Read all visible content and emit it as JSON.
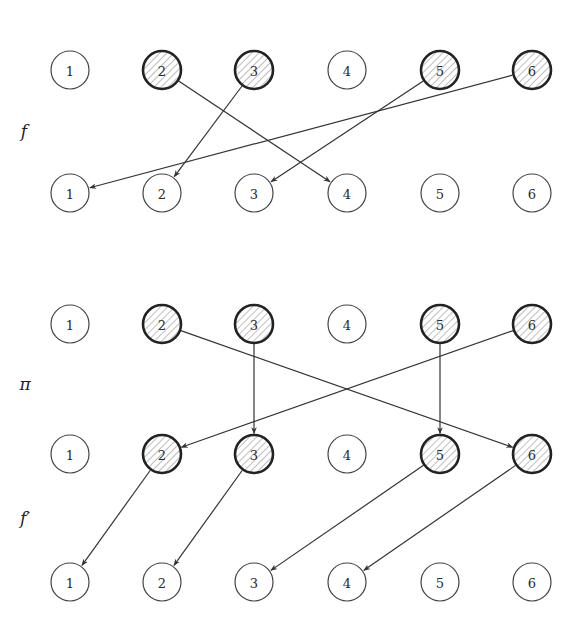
{
  "figure": {
    "width": 582,
    "height": 631,
    "node_radius": 19,
    "column_x": [
      70,
      162,
      254,
      347,
      440,
      532
    ],
    "colors": {
      "ink": "#333333",
      "plain_stroke": "#444444",
      "hatched_stroke": "#222222",
      "hatch_line": "#888888",
      "background": "#ffffff"
    },
    "rows": [
      {
        "id": "f-source",
        "y": 70,
        "labels": [
          "1",
          "2",
          "3",
          "4",
          "5",
          "6"
        ],
        "hatched": [
          "2",
          "3",
          "5",
          "6"
        ]
      },
      {
        "id": "f-target",
        "y": 193,
        "labels": [
          "1",
          "2",
          "3",
          "4",
          "5",
          "6"
        ],
        "hatched": []
      },
      {
        "id": "pi-source",
        "y": 324,
        "labels": [
          "1",
          "2",
          "3",
          "4",
          "5",
          "6"
        ],
        "hatched": [
          "2",
          "3",
          "5",
          "6"
        ]
      },
      {
        "id": "pi-target",
        "y": 454,
        "labels": [
          "1",
          "2",
          "3",
          "4",
          "5",
          "6"
        ],
        "hatched": [
          "2",
          "3",
          "5",
          "6"
        ]
      },
      {
        "id": "fprime-target",
        "y": 582,
        "labels": [
          "1",
          "2",
          "3",
          "4",
          "5",
          "6"
        ],
        "hatched": []
      }
    ],
    "mappings": [
      {
        "name": "f",
        "label": "f",
        "label_pos": [
          24,
          131
        ],
        "from_row": 0,
        "to_row": 1,
        "edges": [
          {
            "from": "2",
            "to": "4"
          },
          {
            "from": "3",
            "to": "2"
          },
          {
            "from": "5",
            "to": "3"
          },
          {
            "from": "6",
            "to": "1"
          }
        ]
      },
      {
        "name": "pi",
        "label": "π",
        "label_pos": [
          25,
          384
        ],
        "from_row": 2,
        "to_row": 3,
        "edges": [
          {
            "from": "2",
            "to": "6"
          },
          {
            "from": "3",
            "to": "3"
          },
          {
            "from": "5",
            "to": "5"
          },
          {
            "from": "6",
            "to": "2"
          }
        ]
      },
      {
        "name": "f-prime",
        "label": "f′",
        "label_pos": [
          25,
          518
        ],
        "from_row": 3,
        "to_row": 4,
        "edges": [
          {
            "from": "2",
            "to": "1"
          },
          {
            "from": "3",
            "to": "2"
          },
          {
            "from": "5",
            "to": "3"
          },
          {
            "from": "6",
            "to": "4"
          }
        ]
      }
    ]
  }
}
